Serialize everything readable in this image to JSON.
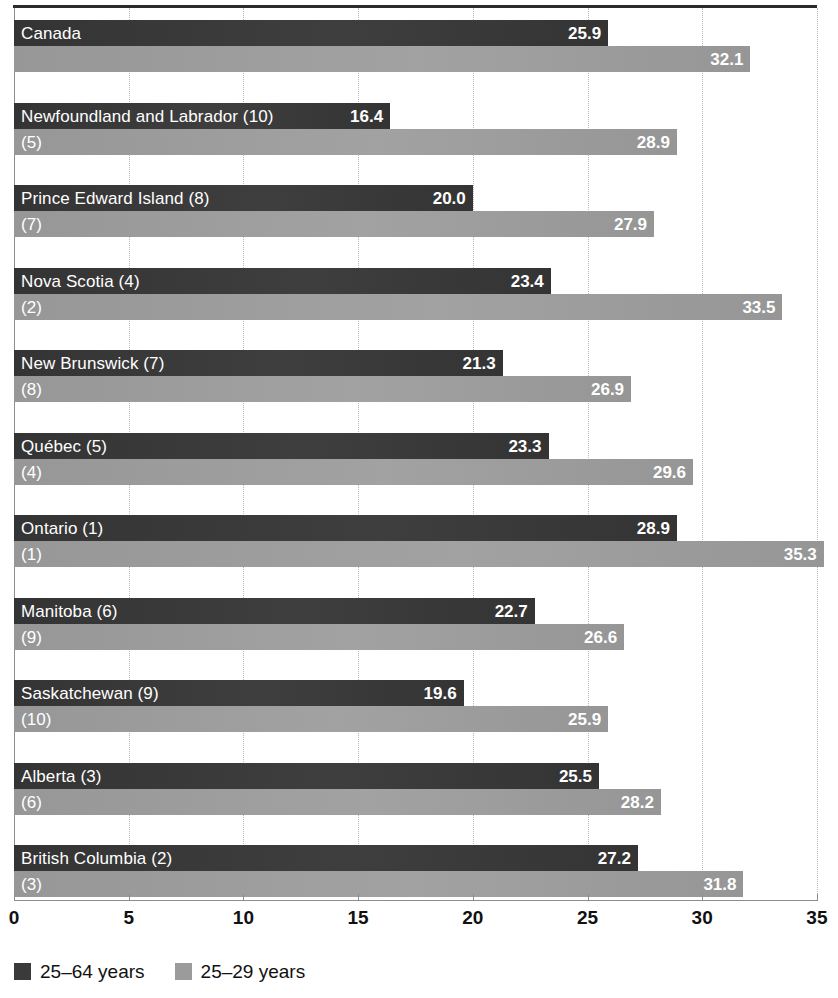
{
  "chart_data": {
    "type": "bar",
    "orientation": "horizontal",
    "title": "",
    "xlabel": "",
    "ylabel": "",
    "xlim": [
      0,
      35
    ],
    "xticks": [
      0,
      5,
      10,
      15,
      20,
      25,
      30,
      35
    ],
    "xtick_labels": [
      "0",
      "5",
      "10",
      "15",
      "20",
      "25",
      "30",
      "35"
    ],
    "grid": true,
    "grid_axis": "x",
    "legend_position": "bottom-left",
    "categories": [
      "Canada",
      "Newfoundland and Labrador (10)",
      "Prince Edward Island (8)",
      "Nova Scotia (4)",
      "New Brunswick (7)",
      "Québec (5)",
      "Ontario (1)",
      "Manitoba (6)",
      "Saskatchewan (9)",
      "Alberta (3)",
      "British Columbia (2)"
    ],
    "secondary_labels": [
      "",
      "(5)",
      "(7)",
      "(2)",
      "(8)",
      "(4)",
      "(1)",
      "(9)",
      "(10)",
      "(6)",
      "(3)"
    ],
    "series": [
      {
        "name": "25–64 years",
        "color": "#3a3a3a",
        "values": [
          25.9,
          16.4,
          20.0,
          23.4,
          21.3,
          23.3,
          28.9,
          22.7,
          19.6,
          25.5,
          27.2
        ],
        "value_labels": [
          "25.9",
          "16.4",
          "20.0",
          "23.4",
          "21.3",
          "23.3",
          "28.9",
          "22.7",
          "19.6",
          "25.5",
          "27.2"
        ]
      },
      {
        "name": "25–29 years",
        "color": "#9b9b9b",
        "values": [
          32.1,
          28.9,
          27.9,
          33.5,
          26.9,
          29.6,
          35.3,
          26.6,
          25.9,
          28.2,
          31.8
        ],
        "value_labels": [
          "32.1",
          "28.9",
          "27.9",
          "33.5",
          "26.9",
          "29.6",
          "35.3",
          "26.6",
          "25.9",
          "28.2",
          "31.8"
        ]
      }
    ]
  },
  "legend": {
    "items": [
      {
        "label": "25–64 years",
        "color": "#3a3a3a"
      },
      {
        "label": "25–29 years",
        "color": "#9b9b9b"
      }
    ]
  }
}
